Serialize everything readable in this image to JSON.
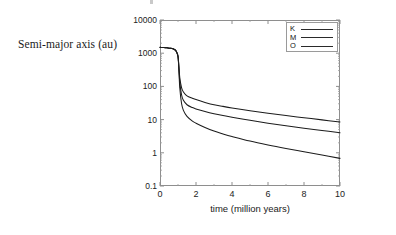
{
  "figure": {
    "y_axis_title": "Semi-major axis (au)",
    "x_axis_title": "time (million years)"
  },
  "legend": {
    "entries": [
      {
        "label": "K"
      },
      {
        "label": "M"
      },
      {
        "label": "O"
      }
    ]
  },
  "axes": {
    "y_ticks": [
      "10000",
      "1000",
      "100",
      "10",
      "1",
      "0.1"
    ],
    "x_ticks": [
      "0",
      "2",
      "4",
      "6",
      "8",
      "10"
    ]
  },
  "chart_data": {
    "type": "line",
    "title": "",
    "subtitle": "",
    "xlabel": "time (million years)",
    "ylabel": "Semi-major axis (au)",
    "xlim": [
      0,
      10
    ],
    "ylim": [
      0.1,
      10000
    ],
    "yscale": "log",
    "xscale": "linear",
    "grid": false,
    "legend_position": "top-right-inside",
    "x_ticks": [
      0,
      2,
      4,
      6,
      8,
      10
    ],
    "y_ticks": [
      0.1,
      1,
      10,
      100,
      1000,
      10000
    ],
    "x": [
      0,
      0.2,
      0.4,
      0.6,
      0.8,
      0.9,
      1.0,
      1.05,
      1.1,
      1.2,
      1.3,
      1.5,
      1.8,
      2.0,
      2.5,
      3.0,
      3.5,
      4.0,
      5.0,
      6.0,
      7.0,
      8.0,
      9.0,
      10.0
    ],
    "series": [
      {
        "name": "K",
        "label": "K",
        "color": "#1c1c1c",
        "values": [
          1500,
          1480,
          1450,
          1400,
          1300,
          1150,
          800,
          400,
          180,
          90,
          68,
          52,
          44,
          40,
          33,
          28,
          25,
          22.5,
          18.5,
          15.5,
          13.2,
          11.4,
          9.8,
          8.5
        ]
      },
      {
        "name": "M",
        "label": "M",
        "color": "#1c1c1c",
        "values": [
          1500,
          1480,
          1450,
          1400,
          1300,
          1150,
          800,
          350,
          130,
          55,
          38,
          28,
          23,
          21,
          17.5,
          15,
          13.2,
          11.8,
          9.5,
          7.8,
          6.5,
          5.5,
          4.7,
          4.0
        ]
      },
      {
        "name": "O",
        "label": "O",
        "color": "#1c1c1c",
        "values": [
          1500,
          1480,
          1450,
          1400,
          1300,
          1150,
          800,
          300,
          90,
          30,
          19,
          12.5,
          9.0,
          7.8,
          5.8,
          4.5,
          3.7,
          3.1,
          2.25,
          1.72,
          1.35,
          1.08,
          0.86,
          0.68
        ]
      }
    ]
  }
}
